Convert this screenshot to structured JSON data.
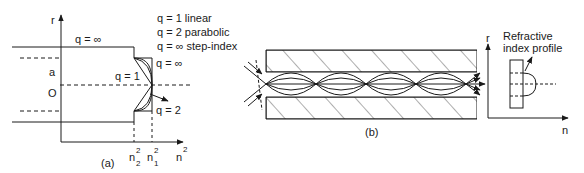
{
  "panel_a": {
    "caption": "(a)",
    "axis_y": "r",
    "axis_x": "n",
    "axis_x_sup": "2",
    "label_a": "a",
    "label_origin": "O",
    "label_q_inf_left": "q = ∞",
    "label_q_inf_right": "q = ∞",
    "label_q1": "q = 1",
    "label_q2": "q = 2",
    "tick_n2": "n",
    "tick_n2_sup": "2",
    "tick_n2_sub": "2",
    "tick_n1": "n",
    "tick_n1_sup": "2",
    "tick_n1_sub": "1",
    "legend": [
      "q = 1 linear",
      "q = 2 parabolic",
      "q = ∞ step-index"
    ]
  },
  "panel_b": {
    "caption": "(b)"
  },
  "panel_c": {
    "axis_y": "r",
    "axis_x": "n",
    "label_line1": "Refractive",
    "label_line2": "index profile"
  }
}
